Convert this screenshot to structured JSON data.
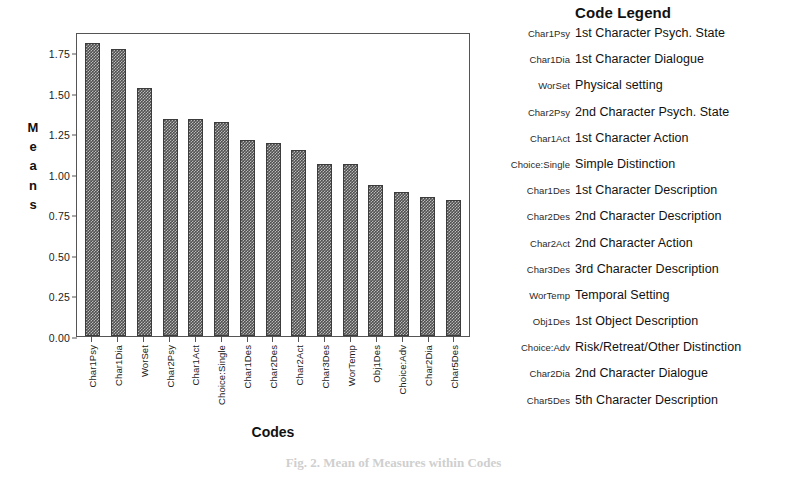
{
  "chart_data": {
    "type": "bar",
    "title": "",
    "xlabel": "Codes",
    "ylabel": "Means",
    "ylim": [
      0.0,
      1.875
    ],
    "yticks": [
      "0.00",
      "0.25",
      "0.50",
      "0.75",
      "1.00",
      "1.25",
      "1.50",
      "1.75"
    ],
    "ytick_values": [
      0.0,
      0.25,
      0.5,
      0.75,
      1.0,
      1.25,
      1.5,
      1.75
    ],
    "grid": false,
    "legend_position": "right",
    "categories": [
      "Char1Psy",
      "Char1Dia",
      "WorSet",
      "Char2Psy",
      "Char1Act",
      "Choice:Single",
      "Char1Des",
      "Char2Des",
      "Char2Act",
      "Char3Des",
      "WorTemp",
      "Obj1Des",
      "Choice:Adv",
      "Char2Dia",
      "Char5Des"
    ],
    "values": [
      1.81,
      1.77,
      1.53,
      1.34,
      1.34,
      1.32,
      1.21,
      1.19,
      1.15,
      1.06,
      1.06,
      0.93,
      0.89,
      0.86,
      0.84
    ]
  },
  "y_axis_title_letters": [
    "M",
    "e",
    "a",
    "n",
    "s"
  ],
  "legend": {
    "title": "Code Legend",
    "rows": [
      {
        "code": "Char1Psy",
        "desc": "1st Character Psych. State"
      },
      {
        "code": "Char1Dia",
        "desc": "1st Character Dialogue"
      },
      {
        "code": "WorSet",
        "desc": "Physical setting"
      },
      {
        "code": "Char2Psy",
        "desc": "2nd Character Psych. State"
      },
      {
        "code": "Char1Act",
        "desc": "1st Character Action"
      },
      {
        "code": "Choice:Single",
        "desc": "Simple Distinction"
      },
      {
        "code": "Char1Des",
        "desc": "1st Character Description"
      },
      {
        "code": "Char2Des",
        "desc": "2nd Character Description"
      },
      {
        "code": "Char2Act",
        "desc": "2nd Character Action"
      },
      {
        "code": "Char3Des",
        "desc": "3rd Character Description"
      },
      {
        "code": "WorTemp",
        "desc": "Temporal Setting"
      },
      {
        "code": "Obj1Des",
        "desc": "1st Object Description"
      },
      {
        "code": "Choice:Adv",
        "desc": "Risk/Retreat/Other Distinction"
      },
      {
        "code": "Char2Dia",
        "desc": "2nd Character Dialogue"
      },
      {
        "code": "Char5Des",
        "desc": "5th Character Description"
      }
    ]
  },
  "caption": "Fig. 2.  Mean of Measures within Codes",
  "colors": {
    "bar_fill": "#4f4f4f",
    "bar_edge": "#3c3c3c",
    "frame": "#555555",
    "text": "#111111"
  }
}
